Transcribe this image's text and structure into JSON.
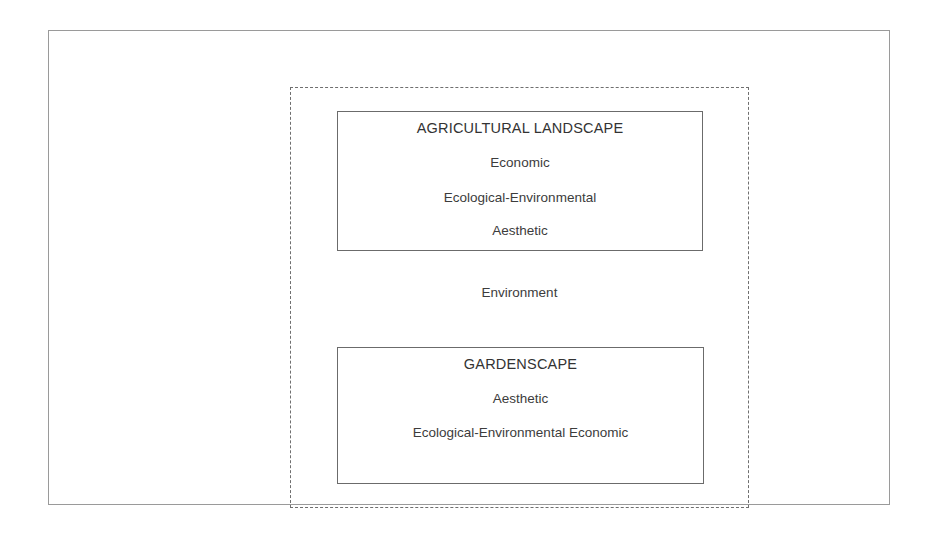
{
  "diagram": {
    "background_color": "#ffffff",
    "outer_frame": {
      "name": "outer-frame",
      "border_color": "#9a9a9a",
      "border_style": "solid"
    },
    "environment_boundary": {
      "name": "environment-boundary",
      "border_color": "#6f6f6f",
      "border_style": "dashed"
    },
    "environment_label": "Environment",
    "boxes": [
      {
        "id": "agricultural-landscape",
        "title": "AGRICULTURAL LANDSCAPE",
        "items": [
          "Economic",
          "Ecological-Environmental",
          "Aesthetic"
        ],
        "border_color": "#6b6b6b",
        "border_style": "solid"
      },
      {
        "id": "gardenscape",
        "title": "GARDENSCAPE",
        "items": [
          "Aesthetic",
          "Ecological-Environmental Economic"
        ],
        "border_color": "#6b6b6b",
        "border_style": "solid"
      }
    ]
  }
}
